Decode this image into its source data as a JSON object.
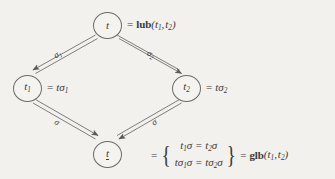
{
  "figure": {
    "type": "lattice-diagram",
    "background_color": "#f2f1ee",
    "ink_color": "#4a4a4a"
  },
  "nodes": {
    "top": {
      "label_main": "t",
      "equation_prefix": "=",
      "operator": "lub",
      "operator_args": "(t1, t2)",
      "equation_text": "= lub(t1, t2)"
    },
    "left": {
      "label_main": "t1",
      "equation_text": "= tσ1"
    },
    "right": {
      "label_main": "t2",
      "equation_text": "= tσ2"
    },
    "bottom": {
      "label_main": "t",
      "underlined": "true",
      "operator": "glb",
      "operator_args": "(t1, t2)",
      "set_row_1": "t1σ = t2σ",
      "set_row_2": "tσ1σ = tσ2σ"
    }
  },
  "edges": [
    {
      "id": "top-to-left",
      "label": "σ1",
      "from": "top",
      "to": "left"
    },
    {
      "id": "top-to-right",
      "label": "σ2",
      "from": "top",
      "to": "right"
    },
    {
      "id": "left-to-bottom",
      "label": "σ",
      "from": "left",
      "to": "bottom"
    },
    {
      "id": "right-to-bottom",
      "label": "σ",
      "from": "right",
      "to": "bottom"
    }
  ],
  "symbols": {
    "equals": "=",
    "left_brace": "{",
    "right_brace": "}"
  }
}
